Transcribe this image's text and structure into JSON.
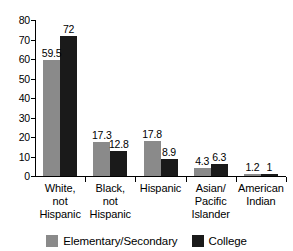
{
  "chart_data": {
    "type": "bar",
    "title": "",
    "subtitle": "",
    "xlabel": "",
    "ylabel": "",
    "ylim": [
      0,
      80
    ],
    "yticks": [
      0,
      10,
      20,
      30,
      40,
      50,
      60,
      70,
      80
    ],
    "ytick_labels": [
      "0",
      "10",
      "20",
      "30",
      "40",
      "50",
      "60",
      "70",
      "80"
    ],
    "grid": false,
    "legend_position": "bottom",
    "categories": [
      "White,\nnot\nHispanic",
      "Black,\nnot\nHispanic",
      "Hispanic",
      "Asian/\nPacific\nIslander",
      "American\nIndian"
    ],
    "series": [
      {
        "name": "Elementary/Secondary",
        "color": "#8a8a8a",
        "values": [
          59.5,
          17.3,
          17.8,
          4.3,
          1.2
        ],
        "labels": [
          "59.5",
          "17.3",
          "17.8",
          "4.3",
          "1.2"
        ]
      },
      {
        "name": "College",
        "color": "#1a1a1a",
        "values": [
          72,
          12.8,
          8.9,
          6.3,
          1
        ],
        "labels": [
          "72",
          "12.8",
          "8.9",
          "6.3",
          "1"
        ]
      }
    ]
  },
  "legend": {
    "items": [
      {
        "label": "Elementary/Secondary",
        "color": "#8a8a8a"
      },
      {
        "label": "College",
        "color": "#1a1a1a"
      }
    ]
  },
  "colors": {
    "elementary_secondary": "#8a8a8a",
    "college": "#1a1a1a",
    "axis": "#000000",
    "background": "#ffffff"
  }
}
